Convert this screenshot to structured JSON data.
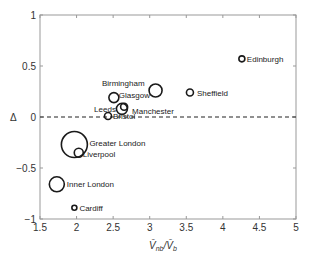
{
  "chart_data": {
    "type": "scatter",
    "title": "",
    "xlabel": "V̄nb/V̄b",
    "ylabel": "Δ",
    "xlim": [
      1.5,
      5
    ],
    "ylim": [
      -1,
      1
    ],
    "xticks": [
      "1.5",
      "2",
      "2.5",
      "3",
      "3.5",
      "4",
      "4.5",
      "5"
    ],
    "yticks": [
      "1",
      "0.5",
      "0",
      "−0.5",
      "−1"
    ],
    "grid": false,
    "legend": null,
    "reference_line": {
      "y": 0,
      "style": "dashed"
    },
    "points": [
      {
        "label": "Edinburgh",
        "x": 4.26,
        "y": 0.57,
        "size": 3
      },
      {
        "label": "Sheffield",
        "x": 3.55,
        "y": 0.24,
        "size": 3.5
      },
      {
        "label": "Birmingham",
        "x": 3.08,
        "y": 0.26,
        "size": 6.5
      },
      {
        "label": "Glasgow",
        "x": 2.51,
        "y": 0.19,
        "size": 5
      },
      {
        "label": "Leeds",
        "x": 2.62,
        "y": 0.08,
        "size": 5.5
      },
      {
        "label": "Manchester",
        "x": 2.65,
        "y": 0.1,
        "size": 3.5
      },
      {
        "label": "Bristol",
        "x": 2.43,
        "y": 0.01,
        "size": 3.5
      },
      {
        "label": "Greater London",
        "x": 1.97,
        "y": -0.27,
        "size": 13
      },
      {
        "label": "Liverpool",
        "x": 2.03,
        "y": -0.35,
        "size": 4.5
      },
      {
        "label": "Inner London",
        "x": 1.73,
        "y": -0.66,
        "size": 7.5
      },
      {
        "label": "Cardiff",
        "x": 1.97,
        "y": -0.89,
        "size": 2.5
      }
    ]
  },
  "labels": {
    "y_axis_symbol": "Δ",
    "x_axis_main": "V̄",
    "x_axis_sub1": "nb",
    "x_axis_sep": "/V̄",
    "x_axis_sub2": "b"
  }
}
